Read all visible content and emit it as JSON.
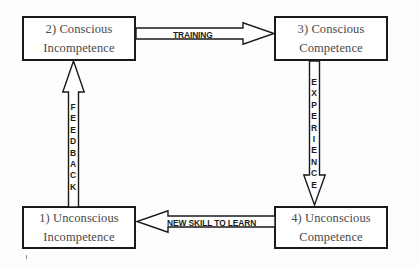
{
  "diagram": {
    "background_color": "#fdfdfd",
    "stroke_color": "#1a1a1a",
    "text_color": "#4a4a4a",
    "label_color": "#1c1c1c",
    "stages": [
      {
        "id": "conscious-incompetence",
        "number": "2)",
        "line1": "2) Conscious",
        "line2": "Incompetence",
        "position": "top-left"
      },
      {
        "id": "conscious-competence",
        "number": "3)",
        "line1": "3) Conscious",
        "line2": "Competence",
        "position": "top-right"
      },
      {
        "id": "unconscious-incompetence",
        "number": "1)",
        "line1": "1) Unconscious",
        "line2": "Incompetence",
        "position": "bottom-left"
      },
      {
        "id": "unconscious-competence",
        "number": "4)",
        "line1": "4) Unconscious",
        "line2": "Competence",
        "position": "bottom-right"
      }
    ],
    "transitions": [
      {
        "id": "training",
        "label": "TRAINING",
        "direction": "right",
        "from": "conscious-incompetence",
        "to": "conscious-competence",
        "orientation": "horizontal"
      },
      {
        "id": "experience",
        "label": "EXPERIENCE",
        "letters": [
          "E",
          "X",
          "P",
          "E",
          "R",
          "I",
          "E",
          "N",
          "C",
          "E"
        ],
        "direction": "down",
        "from": "conscious-competence",
        "to": "unconscious-competence",
        "orientation": "vertical"
      },
      {
        "id": "new-skill-to-learn",
        "label": "NEW SKILL TO LEARN",
        "direction": "left",
        "from": "unconscious-competence",
        "to": "unconscious-incompetence",
        "orientation": "horizontal"
      },
      {
        "id": "feedback",
        "label": "FEEDBACK",
        "letters": [
          "F",
          "E",
          "E",
          "D",
          "B",
          "A",
          "C",
          "K"
        ],
        "direction": "up",
        "from": "unconscious-incompetence",
        "to": "conscious-incompetence",
        "orientation": "vertical"
      }
    ]
  }
}
